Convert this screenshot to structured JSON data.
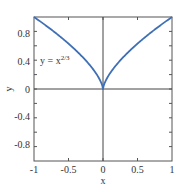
{
  "chart_data": {
    "type": "line",
    "title": "",
    "xlabel": "x",
    "ylabel": "y",
    "xlim": [
      -1,
      1
    ],
    "ylim": [
      -1,
      1
    ],
    "grid": false,
    "x_ticks": [
      -1,
      -0.5,
      0,
      0.5,
      1
    ],
    "x_tick_labels": [
      "-1",
      "-0.5",
      "0",
      "0.5",
      "1"
    ],
    "y_ticks": [
      -0.8,
      -0.4,
      0,
      0.4,
      0.8
    ],
    "y_tick_labels": [
      "-0.8",
      "-0.4",
      "0",
      "0.4",
      "0.8"
    ],
    "y_minor_ticks": [
      -1,
      -0.6,
      -0.2,
      0.2,
      0.6,
      1
    ],
    "series": [
      {
        "name": "y = x^(2/3)",
        "color": "#3f6fb5",
        "function": "y = x^(2/3)",
        "x": [
          -1,
          -0.75,
          -0.5,
          -0.25,
          -0.1,
          0,
          0.1,
          0.25,
          0.5,
          0.75,
          1
        ],
        "y": [
          1,
          0.825,
          0.63,
          0.397,
          0.215,
          0,
          0.215,
          0.397,
          0.63,
          0.825,
          1
        ]
      }
    ],
    "annotations": [
      {
        "text": "y = x",
        "superscript": "2/3",
        "x": -0.85,
        "y": 0.45
      }
    ],
    "reference_lines": [
      {
        "axis": "x",
        "value": 0
      },
      {
        "axis": "y",
        "value": 0
      }
    ]
  },
  "labels": {
    "xlabel": "x",
    "ylabel": "y",
    "annotation_base": "y = x",
    "annotation_sup": "2/3",
    "xticks": [
      "-1",
      "-0.5",
      "0",
      "0.5",
      "1"
    ],
    "yticks": [
      "0.8",
      "0.4",
      "0",
      "-0.4",
      "-0.8"
    ]
  }
}
